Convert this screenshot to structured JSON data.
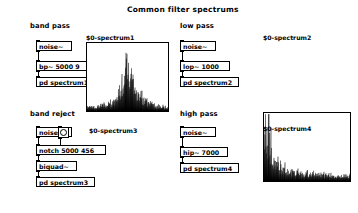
{
  "window": {
    "title": "Common filter spectrums",
    "background": "#ffffff",
    "foreground": "#000000"
  },
  "sections": [
    {
      "id": "band-pass",
      "label": "band pass",
      "objects": [
        {
          "id": "noise1",
          "text": "noise~",
          "type": "object"
        },
        {
          "id": "bp1",
          "text": "bp~ 5000 9",
          "type": "object"
        },
        {
          "id": "sub1",
          "text": "pd spectrum1",
          "type": "subpatch"
        }
      ],
      "graph": {
        "id": "graph1",
        "label": "$0-spectrum1"
      }
    },
    {
      "id": "low-pass",
      "label": "low pass",
      "objects": [
        {
          "id": "noise2",
          "text": "noise~",
          "type": "object"
        },
        {
          "id": "lop2",
          "text": "lop~ 1000",
          "type": "object"
        },
        {
          "id": "sub2",
          "text": "pd spectrum2",
          "type": "subpatch"
        }
      ],
      "graph": {
        "id": "graph2",
        "label": "$0-spectrum2"
      }
    },
    {
      "id": "band-reject",
      "label": "band reject",
      "objects": [
        {
          "id": "noise3",
          "text": "noise~",
          "type": "object"
        },
        {
          "id": "bng3",
          "text": "",
          "type": "bang"
        },
        {
          "id": "notch3",
          "text": "notch 5000 456",
          "type": "message"
        },
        {
          "id": "biquad3",
          "text": "biquad~",
          "type": "object"
        },
        {
          "id": "sub3",
          "text": "pd spectrum3",
          "type": "subpatch"
        }
      ],
      "graph": {
        "id": "graph3",
        "label": "$0-spectrum3"
      }
    },
    {
      "id": "high-pass",
      "label": "high pass",
      "objects": [
        {
          "id": "noise4",
          "text": "noise~",
          "type": "object"
        },
        {
          "id": "hip4",
          "text": "hip~ 7000",
          "type": "object"
        },
        {
          "id": "sub4",
          "text": "pd spectrum4",
          "type": "subpatch"
        }
      ],
      "graph": {
        "id": "graph4",
        "label": "$0-spectrum4"
      }
    }
  ],
  "chart_data": [
    {
      "id": "graph1",
      "type": "area",
      "title": "$0-spectrum1",
      "description": "Band pass filter spectrum, bp~ 5000 9 — narrow resonant peak centred near the middle of the frequency axis",
      "xlabel": "frequency",
      "ylabel": "magnitude",
      "xlim": [
        0,
        1
      ],
      "ylim": [
        0,
        1
      ],
      "grid": false,
      "legend": null,
      "peak_x": 0.5,
      "peak_y": 0.95,
      "noise_floor": 0.1,
      "x": [
        0.0,
        0.03,
        0.06,
        0.09,
        0.12,
        0.15,
        0.18,
        0.21,
        0.24,
        0.27,
        0.3,
        0.33,
        0.36,
        0.39,
        0.42,
        0.45,
        0.47,
        0.5,
        0.53,
        0.56,
        0.59,
        0.62,
        0.65,
        0.68,
        0.71,
        0.74,
        0.77,
        0.8,
        0.83,
        0.86,
        0.89,
        0.92,
        0.95,
        0.98,
        1.0
      ],
      "values": [
        0.07,
        0.08,
        0.06,
        0.09,
        0.08,
        0.1,
        0.09,
        0.12,
        0.11,
        0.14,
        0.16,
        0.2,
        0.24,
        0.3,
        0.4,
        0.55,
        0.72,
        0.95,
        0.74,
        0.58,
        0.44,
        0.36,
        0.3,
        0.25,
        0.21,
        0.18,
        0.15,
        0.13,
        0.11,
        0.1,
        0.09,
        0.08,
        0.07,
        0.06,
        0.05
      ]
    },
    {
      "id": "graph2",
      "type": "area",
      "title": "$0-spectrum2",
      "description": "Low pass filter spectrum, lop~ 1000 — energy concentrated at low frequencies, rolling off to a noise floor",
      "xlabel": "frequency",
      "ylabel": "magnitude",
      "xlim": [
        0,
        1
      ],
      "ylim": [
        0,
        1
      ],
      "grid": false,
      "legend": null,
      "peak_x": 0.03,
      "peak_y": 0.95,
      "noise_floor": 0.1,
      "x": [
        0.0,
        0.02,
        0.04,
        0.06,
        0.08,
        0.1,
        0.13,
        0.16,
        0.19,
        0.22,
        0.25,
        0.3,
        0.35,
        0.4,
        0.45,
        0.5,
        0.55,
        0.6,
        0.65,
        0.7,
        0.75,
        0.8,
        0.85,
        0.9,
        0.95,
        1.0
      ],
      "values": [
        0.7,
        0.95,
        0.8,
        0.88,
        0.62,
        0.5,
        0.4,
        0.33,
        0.28,
        0.24,
        0.21,
        0.18,
        0.16,
        0.15,
        0.14,
        0.13,
        0.13,
        0.12,
        0.12,
        0.11,
        0.11,
        0.1,
        0.1,
        0.09,
        0.09,
        0.08
      ]
    },
    {
      "id": "graph3",
      "type": "area",
      "title": "$0-spectrum3",
      "description": "Band reject (notch) filter spectrum, notch 5000 456 via biquad~ — deep dip in the centre, full level at both edges",
      "xlabel": "frequency",
      "ylabel": "magnitude",
      "xlim": [
        0,
        1
      ],
      "ylim": [
        0,
        1
      ],
      "grid": false,
      "legend": null,
      "notch_x": 0.47,
      "notch_y": 0.02,
      "noise_floor": 0.1,
      "x": [
        0.0,
        0.03,
        0.06,
        0.09,
        0.12,
        0.15,
        0.18,
        0.21,
        0.24,
        0.27,
        0.3,
        0.34,
        0.38,
        0.42,
        0.46,
        0.5,
        0.54,
        0.58,
        0.62,
        0.66,
        0.7,
        0.74,
        0.78,
        0.82,
        0.86,
        0.9,
        0.94,
        0.97,
        1.0
      ],
      "values": [
        0.78,
        0.62,
        0.7,
        0.52,
        0.45,
        0.4,
        0.34,
        0.28,
        0.24,
        0.2,
        0.16,
        0.12,
        0.08,
        0.05,
        0.03,
        0.04,
        0.07,
        0.12,
        0.18,
        0.24,
        0.3,
        0.36,
        0.42,
        0.48,
        0.56,
        0.64,
        0.72,
        0.82,
        0.88
      ]
    },
    {
      "id": "graph4",
      "type": "area",
      "title": "$0-spectrum4",
      "description": "High pass filter spectrum, hip~ 7000 — level rises steadily with frequency, maximum at the right edge",
      "xlabel": "frequency",
      "ylabel": "magnitude",
      "xlim": [
        0,
        1
      ],
      "ylim": [
        0,
        1
      ],
      "grid": false,
      "legend": null,
      "peak_x": 1.0,
      "peak_y": 0.92,
      "noise_floor": 0.05,
      "x": [
        0.0,
        0.04,
        0.08,
        0.12,
        0.16,
        0.2,
        0.24,
        0.28,
        0.32,
        0.36,
        0.4,
        0.44,
        0.48,
        0.52,
        0.56,
        0.6,
        0.64,
        0.68,
        0.72,
        0.76,
        0.8,
        0.84,
        0.88,
        0.92,
        0.96,
        1.0
      ],
      "values": [
        0.04,
        0.06,
        0.08,
        0.1,
        0.13,
        0.16,
        0.2,
        0.24,
        0.28,
        0.33,
        0.38,
        0.43,
        0.47,
        0.52,
        0.56,
        0.6,
        0.64,
        0.68,
        0.72,
        0.76,
        0.8,
        0.83,
        0.86,
        0.89,
        0.91,
        0.92
      ]
    }
  ]
}
